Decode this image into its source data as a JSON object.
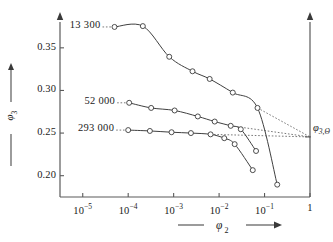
{
  "chart_data": {
    "type": "line",
    "title": "",
    "xlabel": "φ₂",
    "ylabel": "φ₃",
    "xscale": "log",
    "xlim": [
      3.16e-06,
      1
    ],
    "ylim": [
      0.175,
      0.385
    ],
    "grid": false,
    "legend": "inline-left-labels",
    "x_ticks": [
      {
        "value": 1e-05,
        "label": "10⁻⁵",
        "base": "10",
        "exp": "-5"
      },
      {
        "value": 0.0001,
        "label": "10⁻⁴",
        "base": "10",
        "exp": "-4"
      },
      {
        "value": 0.001,
        "label": "10⁻³",
        "base": "10",
        "exp": "-3"
      },
      {
        "value": 0.01,
        "label": "10⁻²",
        "base": "10",
        "exp": "-2"
      },
      {
        "value": 0.1,
        "label": "10⁻¹",
        "base": "10",
        "exp": "-1"
      },
      {
        "value": 1,
        "label": "1",
        "base": "1",
        "exp": ""
      }
    ],
    "y_ticks": [
      {
        "value": 0.35,
        "label": "0.35"
      },
      {
        "value": 0.3,
        "label": "0.30"
      },
      {
        "value": 0.25,
        "label": "0.25"
      },
      {
        "value": 0.2,
        "label": "0.20"
      }
    ],
    "right_axis_label": "φ",
    "right_axis_label_sub": "3,Θ",
    "asymptote_value": 0.2455,
    "series": [
      {
        "name": "13 300",
        "label": "13 300",
        "label_x": 7e-05,
        "label_y": 0.374,
        "points": [
          {
            "x": 5e-05,
            "y": 0.3745
          },
          {
            "x": 0.00021,
            "y": 0.3755
          },
          {
            "x": 0.0008,
            "y": 0.3395
          },
          {
            "x": 0.0026,
            "y": 0.3225
          },
          {
            "x": 0.0062,
            "y": 0.3135
          },
          {
            "x": 0.02,
            "y": 0.2975
          },
          {
            "x": 0.07,
            "y": 0.2795
          },
          {
            "x": 0.19,
            "y": 0.1895
          }
        ],
        "dotted_from": {
          "x": 0.07,
          "y": 0.2795
        },
        "dotted_to": {
          "x": 1.0,
          "y": 0.2455
        }
      },
      {
        "name": "52 000",
        "label": "52 000",
        "label_x": 6.5e-05,
        "label_y": 0.2855,
        "points": [
          {
            "x": 0.000105,
            "y": 0.2855
          },
          {
            "x": 0.00032,
            "y": 0.2795
          },
          {
            "x": 0.00105,
            "y": 0.2765
          },
          {
            "x": 0.0034,
            "y": 0.2695
          },
          {
            "x": 0.008,
            "y": 0.2635
          },
          {
            "x": 0.018,
            "y": 0.2585
          },
          {
            "x": 0.03,
            "y": 0.2545
          },
          {
            "x": 0.065,
            "y": 0.229
          }
        ],
        "dotted_from": {
          "x": 0.018,
          "y": 0.2585
        },
        "dotted_to": {
          "x": 1.0,
          "y": 0.2455
        }
      },
      {
        "name": "293 000",
        "label": "293 000",
        "label_x": 6e-05,
        "label_y": 0.2535,
        "points": [
          {
            "x": 0.0001,
            "y": 0.2535
          },
          {
            "x": 0.0003,
            "y": 0.2525
          },
          {
            "x": 0.0009,
            "y": 0.251
          },
          {
            "x": 0.0024,
            "y": 0.25
          },
          {
            "x": 0.0065,
            "y": 0.2485
          },
          {
            "x": 0.013,
            "y": 0.244
          },
          {
            "x": 0.022,
            "y": 0.237
          },
          {
            "x": 0.055,
            "y": 0.2065
          }
        ],
        "dotted_from": {
          "x": 0.0065,
          "y": 0.2485
        },
        "dotted_to": {
          "x": 1.0,
          "y": 0.2455
        }
      }
    ]
  },
  "axes": {
    "x_title": "φ",
    "x_title_sub": "2",
    "y_title": "φ",
    "y_title_sub": "3"
  }
}
